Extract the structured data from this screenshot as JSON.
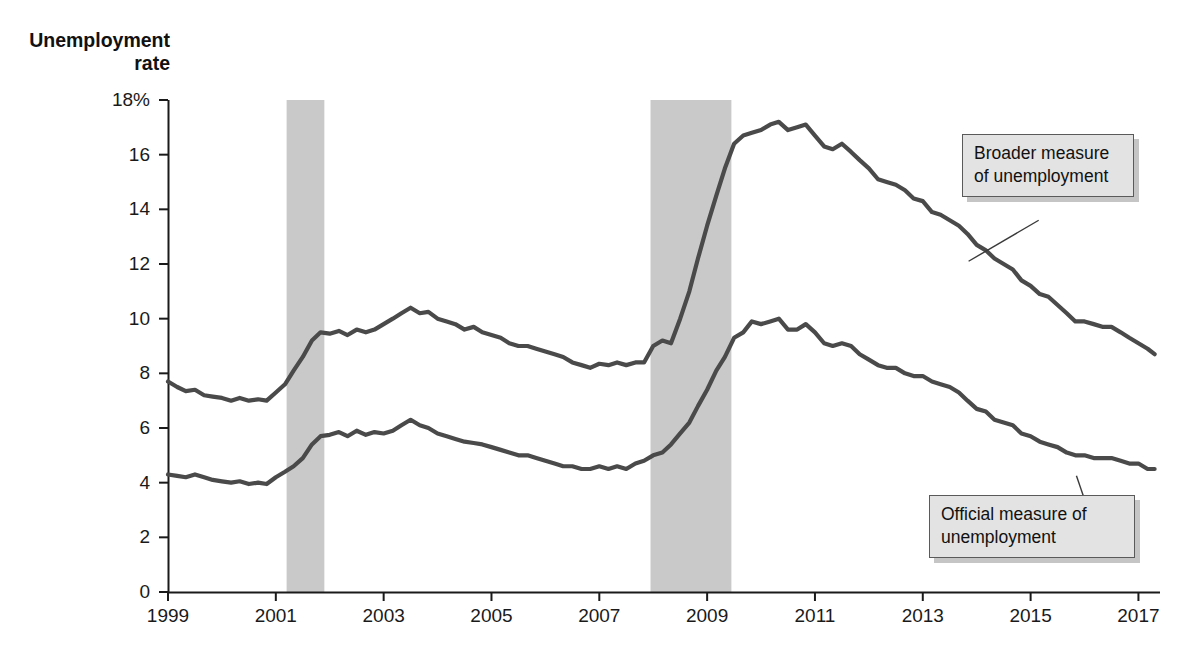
{
  "chart_data": {
    "type": "line",
    "title": "",
    "xlabel": "",
    "ylabel": "Unemployment rate",
    "ylim": [
      0,
      18
    ],
    "xlim": [
      1999,
      2017.4
    ],
    "grid": false,
    "legend_position": "callout-annotations",
    "y_ticks": [
      "0",
      "2",
      "4",
      "6",
      "8",
      "10",
      "12",
      "14",
      "16",
      "18%"
    ],
    "y_tick_values": [
      0,
      2,
      4,
      6,
      8,
      10,
      12,
      14,
      16,
      18
    ],
    "x_ticks": [
      "1999",
      "2001",
      "2003",
      "2005",
      "2007",
      "2009",
      "2011",
      "2013",
      "2015",
      "2017"
    ],
    "x_tick_values": [
      1999,
      2001,
      2003,
      2005,
      2007,
      2009,
      2011,
      2013,
      2015,
      2017
    ],
    "line_color": "#4a4a4a",
    "shaded_band_color": "#c9c9c9",
    "recession_bands": [
      {
        "start": 2001.2,
        "end": 2001.9
      },
      {
        "start": 2007.95,
        "end": 2009.45
      }
    ],
    "series": [
      {
        "name": "Broader measure of unemployment",
        "x": [
          1999.0,
          1999.17,
          1999.33,
          1999.5,
          1999.67,
          1999.83,
          2000.0,
          2000.17,
          2000.33,
          2000.5,
          2000.67,
          2000.83,
          2001.0,
          2001.17,
          2001.33,
          2001.5,
          2001.67,
          2001.83,
          2002.0,
          2002.17,
          2002.33,
          2002.5,
          2002.67,
          2002.83,
          2003.0,
          2003.17,
          2003.33,
          2003.5,
          2003.67,
          2003.83,
          2004.0,
          2004.17,
          2004.33,
          2004.5,
          2004.67,
          2004.83,
          2005.0,
          2005.17,
          2005.33,
          2005.5,
          2005.67,
          2005.83,
          2006.0,
          2006.17,
          2006.33,
          2006.5,
          2006.67,
          2006.83,
          2007.0,
          2007.17,
          2007.33,
          2007.5,
          2007.67,
          2007.83,
          2008.0,
          2008.17,
          2008.33,
          2008.5,
          2008.67,
          2008.83,
          2009.0,
          2009.17,
          2009.33,
          2009.5,
          2009.67,
          2009.83,
          2010.0,
          2010.17,
          2010.33,
          2010.5,
          2010.67,
          2010.83,
          2011.0,
          2011.17,
          2011.33,
          2011.5,
          2011.67,
          2011.83,
          2012.0,
          2012.17,
          2012.33,
          2012.5,
          2012.67,
          2012.83,
          2013.0,
          2013.17,
          2013.33,
          2013.5,
          2013.67,
          2013.83,
          2014.0,
          2014.17,
          2014.33,
          2014.5,
          2014.67,
          2014.83,
          2015.0,
          2015.17,
          2015.33,
          2015.5,
          2015.67,
          2015.83,
          2016.0,
          2016.17,
          2016.33,
          2016.5,
          2016.67,
          2016.83,
          2017.0,
          2017.17,
          2017.3
        ],
        "y": [
          7.7,
          7.5,
          7.35,
          7.4,
          7.2,
          7.15,
          7.1,
          7.0,
          7.1,
          7.0,
          7.05,
          7.0,
          7.3,
          7.6,
          8.1,
          8.6,
          9.2,
          9.5,
          9.45,
          9.55,
          9.4,
          9.6,
          9.5,
          9.6,
          9.8,
          10.0,
          10.2,
          10.4,
          10.2,
          10.25,
          10.0,
          9.9,
          9.8,
          9.6,
          9.7,
          9.5,
          9.4,
          9.3,
          9.1,
          9.0,
          9.0,
          8.9,
          8.8,
          8.7,
          8.6,
          8.4,
          8.3,
          8.2,
          8.35,
          8.3,
          8.4,
          8.3,
          8.4,
          8.4,
          9.0,
          9.2,
          9.1,
          10.0,
          11.0,
          12.2,
          13.4,
          14.5,
          15.5,
          16.4,
          16.7,
          16.8,
          16.9,
          17.1,
          17.2,
          16.9,
          17.0,
          17.1,
          16.7,
          16.3,
          16.2,
          16.4,
          16.1,
          15.8,
          15.5,
          15.1,
          15.0,
          14.9,
          14.7,
          14.4,
          14.3,
          13.9,
          13.8,
          13.6,
          13.4,
          13.1,
          12.7,
          12.5,
          12.2,
          12.0,
          11.8,
          11.4,
          11.2,
          10.9,
          10.8,
          10.5,
          10.2,
          9.9,
          9.9,
          9.8,
          9.7,
          9.7,
          9.5,
          9.3,
          9.1,
          8.9,
          8.7
        ],
        "start_value": 7.7,
        "min_value": 7.0,
        "peak_value": 17.2,
        "end_value": 8.7
      },
      {
        "name": "Official measure of unemployment",
        "x": [
          1999.0,
          1999.17,
          1999.33,
          1999.5,
          1999.67,
          1999.83,
          2000.0,
          2000.17,
          2000.33,
          2000.5,
          2000.67,
          2000.83,
          2001.0,
          2001.17,
          2001.33,
          2001.5,
          2001.67,
          2001.83,
          2002.0,
          2002.17,
          2002.33,
          2002.5,
          2002.67,
          2002.83,
          2003.0,
          2003.17,
          2003.33,
          2003.5,
          2003.67,
          2003.83,
          2004.0,
          2004.17,
          2004.33,
          2004.5,
          2004.67,
          2004.83,
          2005.0,
          2005.17,
          2005.33,
          2005.5,
          2005.67,
          2005.83,
          2006.0,
          2006.17,
          2006.33,
          2006.5,
          2006.67,
          2006.83,
          2007.0,
          2007.17,
          2007.33,
          2007.5,
          2007.67,
          2007.83,
          2008.0,
          2008.17,
          2008.33,
          2008.5,
          2008.67,
          2008.83,
          2009.0,
          2009.17,
          2009.33,
          2009.5,
          2009.67,
          2009.83,
          2010.0,
          2010.17,
          2010.33,
          2010.5,
          2010.67,
          2010.83,
          2011.0,
          2011.17,
          2011.33,
          2011.5,
          2011.67,
          2011.83,
          2012.0,
          2012.17,
          2012.33,
          2012.5,
          2012.67,
          2012.83,
          2013.0,
          2013.17,
          2013.33,
          2013.5,
          2013.67,
          2013.83,
          2014.0,
          2014.17,
          2014.33,
          2014.5,
          2014.67,
          2014.83,
          2015.0,
          2015.17,
          2015.33,
          2015.5,
          2015.67,
          2015.83,
          2016.0,
          2016.17,
          2016.33,
          2016.5,
          2016.67,
          2016.83,
          2017.0,
          2017.17,
          2017.3
        ],
        "y": [
          4.3,
          4.25,
          4.2,
          4.3,
          4.2,
          4.1,
          4.05,
          4.0,
          4.05,
          3.95,
          4.0,
          3.95,
          4.2,
          4.4,
          4.6,
          4.9,
          5.4,
          5.7,
          5.75,
          5.85,
          5.7,
          5.9,
          5.75,
          5.85,
          5.8,
          5.9,
          6.1,
          6.3,
          6.1,
          6.0,
          5.8,
          5.7,
          5.6,
          5.5,
          5.45,
          5.4,
          5.3,
          5.2,
          5.1,
          5.0,
          5.0,
          4.9,
          4.8,
          4.7,
          4.6,
          4.6,
          4.5,
          4.5,
          4.6,
          4.5,
          4.6,
          4.5,
          4.7,
          4.8,
          5.0,
          5.1,
          5.4,
          5.8,
          6.2,
          6.8,
          7.4,
          8.1,
          8.6,
          9.3,
          9.5,
          9.9,
          9.8,
          9.9,
          10.0,
          9.6,
          9.6,
          9.8,
          9.5,
          9.1,
          9.0,
          9.1,
          9.0,
          8.7,
          8.5,
          8.3,
          8.2,
          8.2,
          8.0,
          7.9,
          7.9,
          7.7,
          7.6,
          7.5,
          7.3,
          7.0,
          6.7,
          6.6,
          6.3,
          6.2,
          6.1,
          5.8,
          5.7,
          5.5,
          5.4,
          5.3,
          5.1,
          5.0,
          5.0,
          4.9,
          4.9,
          4.9,
          4.8,
          4.7,
          4.7,
          4.5,
          4.5
        ],
        "start_value": 4.3,
        "min_value": 3.95,
        "peak_value": 10.0,
        "end_value": 4.5
      }
    ],
    "annotations": [
      {
        "id": "broader",
        "text": "Broader measure\nof unemployment",
        "line_from": {
          "x": 2015.15,
          "y": 13.6
        },
        "line_to": {
          "x": 2013.85,
          "y": 12.1
        }
      },
      {
        "id": "official",
        "text": "Official measure of\nunemployment",
        "line_from": {
          "x": 2016.25,
          "y": 1.95
        },
        "line_to": {
          "x": 2015.85,
          "y": 4.25
        }
      }
    ]
  },
  "axis": {
    "y_title": "Unemployment\nrate"
  },
  "annotations": {
    "broader_label": "Broader measure\nof unemployment",
    "official_label": "Official measure of\nunemployment"
  }
}
